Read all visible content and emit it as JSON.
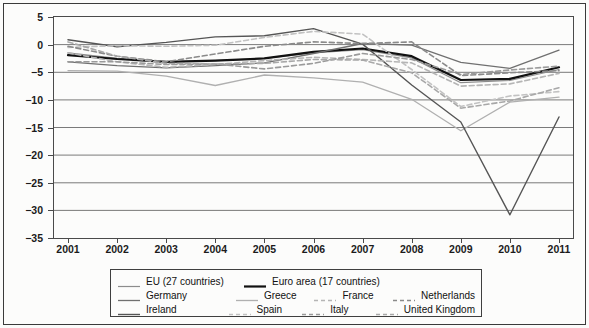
{
  "figure": {
    "background": "#fcfcfb",
    "frame_color": "#3a3a3a"
  },
  "axes": {
    "y_ticks": [
      "5",
      "0",
      "-5",
      "-10",
      "-15",
      "-20",
      "-25",
      "-30",
      "-35"
    ],
    "y_tick_values": [
      5,
      0,
      -5,
      -10,
      -15,
      -20,
      -25,
      -30,
      -35
    ],
    "x_ticks": [
      "2001",
      "2002",
      "2003",
      "2004",
      "2005",
      "2006",
      "2007",
      "2008",
      "2009",
      "2010",
      "2011"
    ],
    "ylim": [
      -35,
      5
    ],
    "grid": "horizontal"
  },
  "legend": {
    "rows": [
      [
        {
          "label": "EU (27 countries)",
          "style": "solid",
          "color": "#8c8c8c",
          "width": 1.2,
          "col": "col-a"
        },
        {
          "label": "Euro area (17 countries)",
          "style": "solid",
          "color": "#111111",
          "width": 2.2,
          "col": "wide"
        }
      ],
      [
        {
          "label": "Germany",
          "style": "solid",
          "color": "#707070",
          "width": 1.3,
          "col": "col-a"
        },
        {
          "label": "Greece",
          "style": "solid",
          "color": "#b0b0b0",
          "width": 1.3,
          "col": "col-b"
        },
        {
          "label": "France",
          "style": "dashed",
          "color": "#b5b5b5",
          "width": 1.6,
          "col": "col-c"
        },
        {
          "label": "Netherlands",
          "style": "dashed",
          "color": "#8a8a8a",
          "width": 1.6,
          "col": "col-d"
        }
      ],
      [
        {
          "label": "Ireland",
          "style": "solid",
          "color": "#555555",
          "width": 1.4,
          "col": "col-a"
        },
        {
          "label": "Spain",
          "style": "dashed",
          "color": "#c2c2c2",
          "width": 1.6,
          "col": "col-b"
        },
        {
          "label": "Italy",
          "style": "dashed",
          "color": "#9a9a9a",
          "width": 1.6,
          "col": "col-c"
        },
        {
          "label": "United Kingdom",
          "style": "dashed",
          "color": "#a8a8a8",
          "width": 1.6,
          "col": "col-d"
        }
      ]
    ]
  },
  "chart_data": {
    "type": "line",
    "title": "",
    "xlabel": "",
    "ylabel": "",
    "ylim": [
      -35,
      5
    ],
    "grid": true,
    "legend_position": "bottom",
    "categories": [
      "2001",
      "2002",
      "2003",
      "2004",
      "2005",
      "2006",
      "2007",
      "2008",
      "2009",
      "2010",
      "2011"
    ],
    "x": [
      2001,
      2002,
      2003,
      2004,
      2005,
      2006,
      2007,
      2008,
      2009,
      2010,
      2011
    ],
    "series": [
      {
        "name": "EU (27 countries)",
        "style": "solid",
        "color": "#8c8c8c",
        "width": 1.2,
        "values": [
          -1.5,
          -2.5,
          -3.1,
          -2.9,
          -2.5,
          -1.5,
          -0.9,
          -2.4,
          -6.9,
          -6.5,
          -4.5
        ]
      },
      {
        "name": "Euro area (17 countries)",
        "style": "solid",
        "color": "#111111",
        "width": 2.2,
        "values": [
          -1.9,
          -2.6,
          -3.1,
          -2.9,
          -2.5,
          -1.3,
          -0.7,
          -2.1,
          -6.4,
          -6.2,
          -4.1
        ]
      },
      {
        "name": "Germany",
        "style": "solid",
        "color": "#707070",
        "width": 1.3,
        "values": [
          -3.1,
          -3.8,
          -4.2,
          -3.8,
          -3.3,
          -1.6,
          0.2,
          -0.1,
          -3.2,
          -4.3,
          -1.0
        ]
      },
      {
        "name": "Greece",
        "style": "solid",
        "color": "#b0b0b0",
        "width": 1.3,
        "values": [
          -4.7,
          -4.8,
          -5.7,
          -7.4,
          -5.5,
          -6.0,
          -6.8,
          -9.9,
          -15.6,
          -10.4,
          -9.5
        ]
      },
      {
        "name": "Ireland",
        "style": "solid",
        "color": "#555555",
        "width": 1.4,
        "values": [
          0.9,
          -0.4,
          0.4,
          1.4,
          1.6,
          2.9,
          0.1,
          -7.3,
          -14.0,
          -30.8,
          -13.1
        ]
      },
      {
        "name": "Spain",
        "style": "dashed",
        "color": "#c2c2c2",
        "width": 1.6,
        "values": [
          -0.5,
          -0.2,
          -0.3,
          -0.1,
          1.3,
          2.4,
          1.9,
          -4.5,
          -11.2,
          -9.3,
          -8.5
        ]
      },
      {
        "name": "France",
        "style": "dashed",
        "color": "#b5b5b5",
        "width": 1.6,
        "values": [
          -1.5,
          -3.1,
          -4.1,
          -3.6,
          -2.9,
          -2.3,
          -2.7,
          -3.3,
          -7.5,
          -7.1,
          -5.2
        ]
      },
      {
        "name": "Italy",
        "style": "dashed",
        "color": "#9a9a9a",
        "width": 1.6,
        "values": [
          -3.1,
          -3.1,
          -3.6,
          -3.5,
          -4.4,
          -3.4,
          -1.6,
          -2.7,
          -5.4,
          -4.6,
          -3.9
        ]
      },
      {
        "name": "Netherlands",
        "style": "dashed",
        "color": "#8a8a8a",
        "width": 1.6,
        "values": [
          -0.3,
          -2.1,
          -3.1,
          -1.7,
          -0.3,
          0.5,
          0.2,
          0.5,
          -5.6,
          -5.1,
          -4.7
        ]
      },
      {
        "name": "United Kingdom",
        "style": "dashed",
        "color": "#a8a8a8",
        "width": 1.6,
        "values": [
          0.5,
          -2.1,
          -3.4,
          -3.5,
          -3.4,
          -2.7,
          -2.8,
          -5.1,
          -11.5,
          -10.2,
          -7.8
        ]
      }
    ]
  }
}
